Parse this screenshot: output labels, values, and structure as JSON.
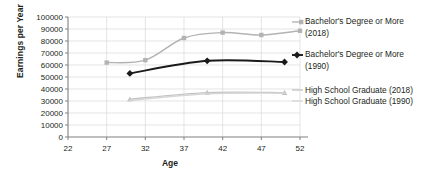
{
  "chart_data": {
    "type": "line",
    "title": "",
    "xlabel": "Age",
    "ylabel": "Earnings per Year",
    "xlim": [
      22,
      52
    ],
    "ylim": [
      0,
      100000
    ],
    "xticks": [
      22,
      27,
      32,
      37,
      42,
      47,
      52
    ],
    "yticks": [
      0,
      10000,
      20000,
      30000,
      40000,
      50000,
      60000,
      70000,
      80000,
      90000,
      100000
    ],
    "grid": true,
    "legend_position": "right",
    "series": [
      {
        "name": "Bachelor's Degree or More (2018)",
        "color": "#b3b3b3",
        "marker": "square",
        "x": [
          27,
          32,
          37,
          42,
          47,
          52
        ],
        "values": [
          62000,
          64000,
          82500,
          87000,
          85000,
          88500
        ]
      },
      {
        "name": "Bachelor's Degree or More (1990)",
        "color": "#1a1a1a",
        "marker": "diamond",
        "x": [
          30,
          40,
          50
        ],
        "values": [
          53000,
          63500,
          62500
        ]
      },
      {
        "name": "High School Graduate (2018)",
        "color": "#c4c4c4",
        "marker": "triangle",
        "x": [
          30,
          40,
          50
        ],
        "values": [
          31500,
          37000,
          37000
        ]
      },
      {
        "name": "High School Graduate (1990)",
        "color": "#d6d6d6",
        "marker": "none",
        "x": [
          30,
          40,
          50
        ],
        "values": [
          30500,
          36000,
          36500
        ]
      }
    ]
  },
  "axis": {
    "y_title": "Earnings per Year",
    "x_title": "Age",
    "y_tick_labels": [
      "100000",
      "90000",
      "80000",
      "70000",
      "60000",
      "50000",
      "40000",
      "30000",
      "20000",
      "10000",
      "0"
    ],
    "x_tick_labels": [
      "22",
      "27",
      "32",
      "37",
      "42",
      "47",
      "52"
    ]
  },
  "legend": {
    "entry1_line1": "Bachelor's Degree or More",
    "entry1_line2": "(2018)",
    "entry2_line1": "Bachelor's Degree or More",
    "entry2_line2": "(1990)",
    "entry3": "High School Graduate (2018)",
    "entry4": "High School Graduate (1990)"
  },
  "colors": {
    "series_2018_bachelor": "#b3b3b3",
    "series_1990_bachelor": "#1a1a1a",
    "series_2018_hs": "#c4c4c4",
    "series_1990_hs": "#d6d6d6",
    "grid": "#d9d9d9",
    "axis": "#808080",
    "text": "#231f20"
  }
}
